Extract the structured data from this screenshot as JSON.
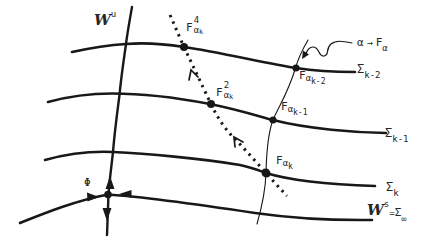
{
  "diagram": {
    "colors": {
      "background": "#ffffff",
      "ink": "#181818",
      "label": "#262626"
    },
    "labels": {
      "unstable_manifold": {
        "base": "W",
        "sup": "u"
      },
      "fixed_point": "Φ",
      "orbit_f4": {
        "base": "F",
        "sup": "4",
        "sub": "α",
        "subsub": "k"
      },
      "orbit_f2": {
        "base": "F",
        "sup": "2",
        "sub": "α",
        "subsub": "k"
      },
      "f_alpha_k2": {
        "base": "F",
        "sub": "α",
        "subsub": "k-2"
      },
      "f_alpha_k1": {
        "base": "F",
        "sub": "α",
        "subsub": "k-1"
      },
      "f_alpha_k": {
        "base": "F",
        "sub": "α",
        "subsub": "k"
      },
      "family_map": {
        "param": "α",
        "arrow": "→",
        "base": "F",
        "sub": "α"
      },
      "sigma_k2": {
        "base": "Σ",
        "sub": "k-2"
      },
      "sigma_k1": {
        "base": "Σ",
        "sub": "k-1"
      },
      "sigma_k": {
        "base": "Σ",
        "sub": "k"
      },
      "stable_manifold": {
        "base": "W",
        "sup": "s",
        "eq": "=",
        "sigma": "Σ",
        "sub": "∞"
      }
    }
  }
}
